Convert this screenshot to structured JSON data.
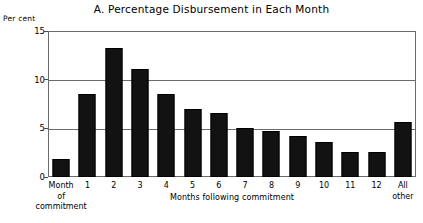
{
  "chart_data": {
    "type": "bar",
    "title": "A.  Percentage Disbursement in Each Month",
    "xlabel": "Months following commitment",
    "ylabel": "Per cent",
    "ylim": [
      0,
      15
    ],
    "yticks": [
      0,
      5,
      10,
      15
    ],
    "ytick_labels": [
      "0",
      "5",
      "10",
      "15"
    ],
    "grid": true,
    "legend": null,
    "bar_color": "#121212",
    "axis_color": "#6b6b6b",
    "categories": [
      "Month of commitment",
      "1",
      "2",
      "3",
      "4",
      "5",
      "6",
      "7",
      "8",
      "9",
      "10",
      "11",
      "12",
      "All other"
    ],
    "category_labels": [
      {
        "line1": "Month",
        "line2": "of",
        "line3": "commitment"
      },
      {
        "line1": "1"
      },
      {
        "line1": "2"
      },
      {
        "line1": "3"
      },
      {
        "line1": "4"
      },
      {
        "line1": "5"
      },
      {
        "line1": "6"
      },
      {
        "line1": "7"
      },
      {
        "line1": "8"
      },
      {
        "line1": "9"
      },
      {
        "line1": "10"
      },
      {
        "line1": "11"
      },
      {
        "line1": "12"
      },
      {
        "line1": "All",
        "line2": "other"
      }
    ],
    "values": [
      1.9,
      8.5,
      13.3,
      11.1,
      8.5,
      7.0,
      6.6,
      5.0,
      4.7,
      4.2,
      3.6,
      2.6,
      2.6,
      5.7
    ]
  }
}
